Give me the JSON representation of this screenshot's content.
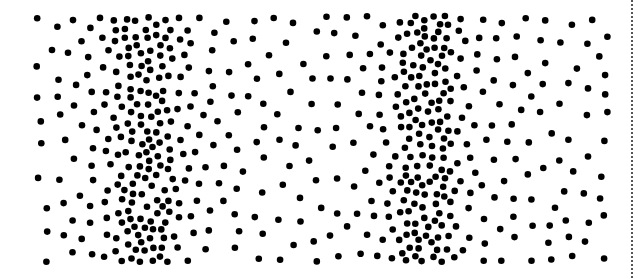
{
  "image": {
    "description": "Stippled dot-density pattern with two dense vertical bands",
    "width": 640,
    "height": 278,
    "background": "#ffffff",
    "dot_color": "#000000",
    "dot_radius": 3.3,
    "region": {
      "x0": 36,
      "y0": 16,
      "x1": 608,
      "y1": 262
    },
    "bands": [
      {
        "center_x": 145,
        "spread": 45,
        "density": 1.0
      },
      {
        "center_x": 425,
        "spread": 45,
        "density": 1.0
      }
    ],
    "base_density": 0.12,
    "right_border": {
      "x": 632,
      "style": "dotted",
      "color": "#555555"
    }
  }
}
